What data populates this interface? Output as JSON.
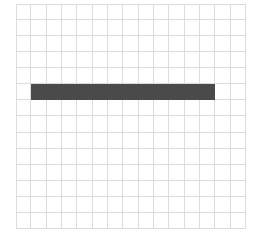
{
  "board": {
    "cols": 15,
    "rows": 14,
    "grid_color": "#dcdcdc",
    "background": "#ffffff"
  },
  "pieces": [
    {
      "name": "horizontal-bar",
      "row": 5,
      "col_start": 1,
      "col_end": 13,
      "color": "#4a4a4a"
    }
  ]
}
